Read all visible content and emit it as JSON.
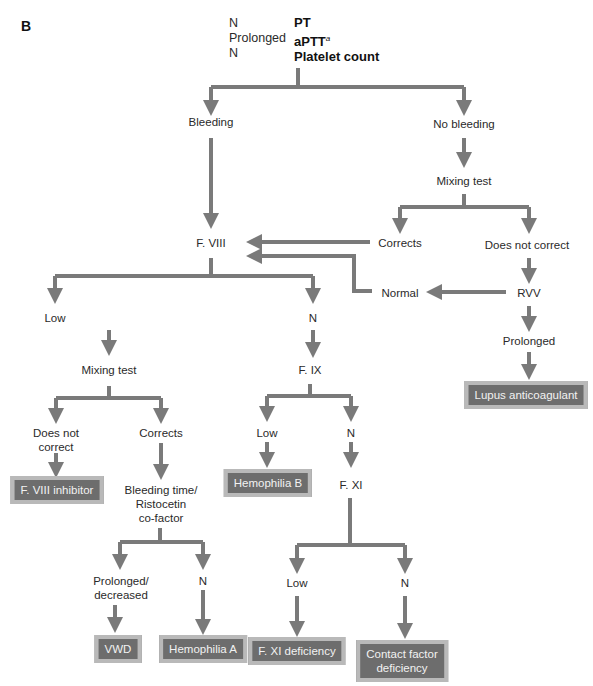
{
  "panel_label": "B",
  "header": {
    "results": [
      "N",
      "Prolonged",
      "N"
    ],
    "tests": [
      "PT",
      "aPTT",
      "Platelet count"
    ],
    "aptt_footnote": "a"
  },
  "nodes": {
    "bleeding": "Bleeding",
    "no_bleeding": "No bleeding",
    "mixing_test_1": "Mixing test",
    "corrects_1": "Corrects",
    "does_not_correct_1": "Does not correct",
    "f8": "F. VIII",
    "rvv": "RVV",
    "normal": "Normal",
    "rvv_prolonged": "Prolonged",
    "lupus": "Lupus anticoagulant",
    "f8_low": "Low",
    "f8_n": "N",
    "mixing_test_2": "Mixing test",
    "does_not_correct_2_l1": "Does not",
    "does_not_correct_2_l2": "correct",
    "corrects_2": "Corrects",
    "f8_inhibitor": "F. VIII inhibitor",
    "bt_l1": "Bleeding time/",
    "bt_l2": "Ristocetin",
    "bt_l3": "co-factor",
    "pd_l1": "Prolonged/",
    "pd_l2": "decreased",
    "bt_n": "N",
    "vwd": "VWD",
    "hemophilia_a": "Hemophilia A",
    "f9": "F. IX",
    "f9_low": "Low",
    "f9_n": "N",
    "hemophilia_b": "Hemophilia B",
    "f11": "F. XI",
    "f11_low": "Low",
    "f11_n": "N",
    "f11_def": "F. XI deficiency",
    "contact_l1": "Contact factor",
    "contact_l2": "deficiency"
  },
  "colors": {
    "arrow": "#7a7a7a",
    "box_fill": "#6d6d6d",
    "box_border": "#b9b9b9",
    "box_text": "#f2f2f2"
  }
}
